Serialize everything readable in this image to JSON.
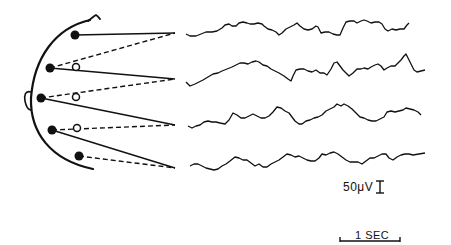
{
  "figure": {
    "type": "EEG montage diagram",
    "head": {
      "view": "side profile, facing left",
      "features": [
        "scalp-outline",
        "ear",
        "nose-bump"
      ]
    },
    "electrodes": {
      "active": [
        {
          "id": "e1",
          "x": 75,
          "y": 35
        },
        {
          "id": "e2",
          "x": 50,
          "y": 68
        },
        {
          "id": "e3",
          "x": 41,
          "y": 98
        },
        {
          "id": "e4",
          "x": 52,
          "y": 130
        },
        {
          "id": "e5",
          "x": 79,
          "y": 156
        }
      ],
      "reference": [
        {
          "id": "r1",
          "x": 76,
          "y": 67
        },
        {
          "id": "r2",
          "x": 76,
          "y": 97
        },
        {
          "id": "r3",
          "x": 77,
          "y": 128
        }
      ]
    },
    "channels": [
      {
        "index": 1,
        "solid_from": "e1",
        "dashed_from": "e2",
        "apex": [
          175,
          33
        ]
      },
      {
        "index": 2,
        "solid_from": "e2",
        "dashed_from": "e3",
        "apex": [
          175,
          79
        ]
      },
      {
        "index": 3,
        "solid_from": "e3",
        "dashed_from": "e4",
        "apex": [
          175,
          125
        ]
      },
      {
        "index": 4,
        "solid_from": "e4",
        "dashed_from": "e5",
        "apex": [
          175,
          168
        ]
      }
    ],
    "traces_count": 4,
    "calibration": {
      "amplitude_label": "50μV",
      "time_label": "1 SEC"
    },
    "colors": {
      "ink": "#111111",
      "background": "#ffffff"
    }
  }
}
